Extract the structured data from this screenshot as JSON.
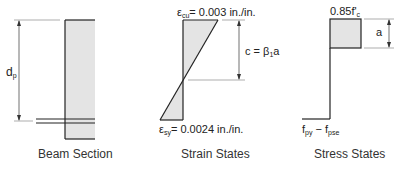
{
  "colors": {
    "line": "#222222",
    "fill": "#e4e4e4",
    "dim_line": "#555555"
  },
  "beam_section": {
    "caption": "Beam Section",
    "dimension": {
      "symbol": "d",
      "subscript": "p"
    }
  },
  "strain_states": {
    "caption": "Strain States",
    "top_label": {
      "symbol": "ε",
      "subscript": "cu",
      "value": "= 0.003 in./in."
    },
    "bottom_label": {
      "symbol": "ε",
      "subscript": "sy",
      "value": "= 0.0024 in./in."
    },
    "neutral_axis": {
      "lhs": "c = β",
      "subscript": "1",
      "rhs": "a"
    }
  },
  "stress_states": {
    "caption": "Stress States",
    "top_label": {
      "prefix": "0.85f'",
      "subscript": "c"
    },
    "block_depth": "a",
    "bottom_label": {
      "f1": "f",
      "sub1": "py",
      "op": " − f",
      "sub2": "pse"
    }
  }
}
